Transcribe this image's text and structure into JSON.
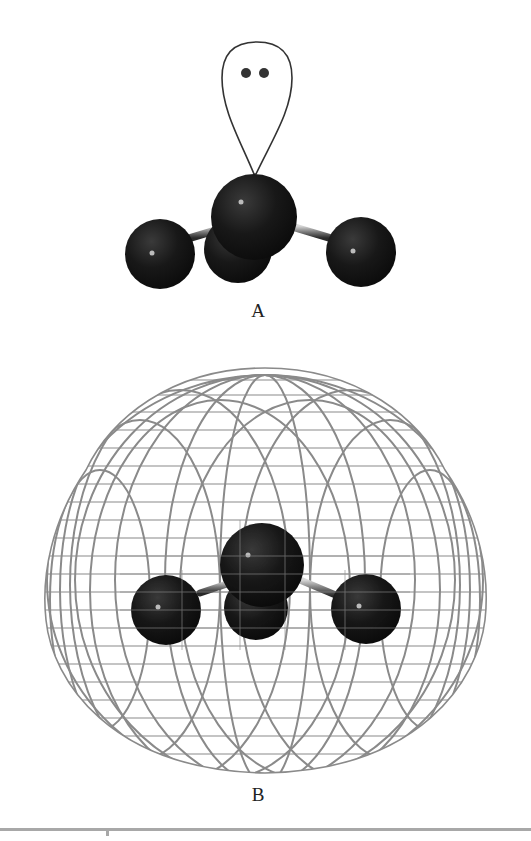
{
  "figure": {
    "panels": [
      {
        "id": "A",
        "label": "A",
        "description": "Ball-and-stick trigonal pyramidal molecule with lone pair orbital lobe containing two electron dots"
      },
      {
        "id": "B",
        "label": "B",
        "description": "Ball-and-stick trigonal pyramidal molecule enclosed in wireframe electron-density surface"
      }
    ],
    "colors": {
      "atom": "#141414",
      "bond": "#5a5a5a",
      "mesh": "#8a8a8a",
      "outline": "#333333",
      "rule": "#a8a8a8"
    }
  }
}
